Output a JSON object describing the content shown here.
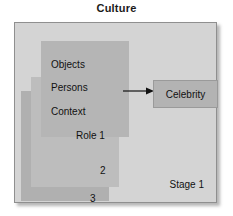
{
  "figure": {
    "title": "Culture",
    "frame_label": "Stage 1"
  },
  "layers": [
    {
      "name": "layer-1",
      "lines": [
        "Objects",
        "Persons",
        "Context",
        "Role 1"
      ]
    },
    {
      "name": "layer-2",
      "lines": [
        "2"
      ]
    },
    {
      "name": "layer-3",
      "lines": [
        "3"
      ]
    }
  ],
  "labels": {
    "objects": "Objects",
    "persons": "Persons",
    "context": "Context",
    "role1": "Role 1",
    "role2": "2",
    "role3": "3",
    "celebrity": "Celebrity"
  },
  "connector": {
    "from": "Persons",
    "to": "Celebrity",
    "icon": "arrow-right-icon"
  },
  "colors": {
    "frame_fill": "#d4d4d4",
    "frame_border": "#8f8f8f",
    "layer1_fill": "#b5b5b5",
    "layer2_fill": "#bdbdbd",
    "layer3_fill": "#b0b0b0",
    "celebrity_fill": "#b3b3b3",
    "text": "#111111",
    "background": "#ffffff"
  }
}
